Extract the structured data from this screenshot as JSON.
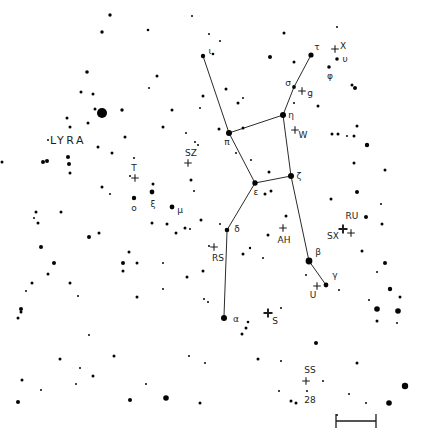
{
  "canvas": {
    "width": 427,
    "height": 441,
    "background": "#ffffff",
    "star_color": "#050505",
    "line_color": "#2b2b2b",
    "label_color": "#1c1c1c"
  },
  "constellation_label": {
    "text": "LYRA",
    "x": 68,
    "y": 141
  },
  "chart_data": {
    "type": "scatter",
    "constellation_lines": [
      [
        203,
        56,
        229,
        133
      ],
      [
        229,
        133,
        283,
        115
      ],
      [
        283,
        115,
        291,
        176
      ],
      [
        291,
        176,
        255,
        183
      ],
      [
        255,
        183,
        229,
        133
      ],
      [
        283,
        115,
        294,
        87
      ],
      [
        294,
        87,
        311,
        55
      ],
      [
        291,
        176,
        309,
        261
      ],
      [
        309,
        261,
        326,
        285
      ],
      [
        255,
        183,
        227,
        230
      ],
      [
        227,
        232,
        224,
        316
      ]
    ],
    "named_stars": [
      {
        "label": "ι",
        "x": 203,
        "y": 56,
        "r": 2.2,
        "lx": 210,
        "ly": 51
      },
      {
        "label": "τ",
        "x": 311,
        "y": 55,
        "r": 2.6,
        "lx": 317,
        "ly": 47
      },
      {
        "label": "σ",
        "x": 294,
        "y": 87,
        "r": 1.9,
        "lx": 288,
        "ly": 83
      },
      {
        "label": "η",
        "x": 283,
        "y": 115,
        "r": 3.0,
        "lx": 291,
        "ly": 115
      },
      {
        "label": "π",
        "x": 229,
        "y": 133,
        "r": 3.0,
        "lx": 227,
        "ly": 142
      },
      {
        "label": "ζ",
        "x": 291,
        "y": 176,
        "r": 3.0,
        "lx": 299,
        "ly": 176
      },
      {
        "label": "ε",
        "x": 255,
        "y": 183,
        "r": 2.7,
        "lx": 256,
        "ly": 192
      },
      {
        "label": "δ",
        "x": 227,
        "y": 230,
        "r": 2.3,
        "lx": 237,
        "ly": 229
      },
      {
        "label": "β",
        "x": 309,
        "y": 261,
        "r": 3.4,
        "lx": 318,
        "ly": 252
      },
      {
        "label": "γ",
        "x": 326,
        "y": 285,
        "r": 2.4,
        "lx": 335,
        "ly": 275
      },
      {
        "label": "α",
        "x": 224,
        "y": 318,
        "r": 3.0,
        "lx": 236,
        "ly": 319
      },
      {
        "label": "μ",
        "x": 172,
        "y": 207,
        "r": 2.4,
        "lx": 180,
        "ly": 210
      },
      {
        "label": "ξ",
        "x": 152,
        "y": 192,
        "r": 2.4,
        "lx": 153,
        "ly": 204
      },
      {
        "label": "ο",
        "x": 134,
        "y": 198,
        "r": 2.2,
        "lx": 134,
        "ly": 208
      },
      {
        "label": "υ",
        "x": 337,
        "y": 59,
        "r": 1.8,
        "lx": 345,
        "ly": 59
      },
      {
        "label": "φ",
        "x": 329,
        "y": 67,
        "r": 1.8,
        "lx": 330,
        "ly": 76
      }
    ],
    "variable_markers": [
      {
        "label": "X",
        "x": 335,
        "y": 49,
        "lx": 343,
        "ly": 46,
        "bold": false
      },
      {
        "label": "g",
        "x": 302,
        "y": 91,
        "lx": 310,
        "ly": 93,
        "bold": false
      },
      {
        "label": "W",
        "x": 295,
        "y": 130,
        "lx": 303,
        "ly": 135,
        "bold": false
      },
      {
        "label": "SZ",
        "x": 188,
        "y": 163,
        "lx": 191,
        "ly": 153,
        "bold": false
      },
      {
        "label": "T",
        "x": 135,
        "y": 178,
        "lx": 134,
        "ly": 168,
        "bold": false
      },
      {
        "label": "RS",
        "x": 214,
        "y": 247,
        "lx": 218,
        "ly": 258,
        "bold": false
      },
      {
        "label": "AH",
        "x": 283,
        "y": 228,
        "lx": 284,
        "ly": 240,
        "bold": false
      },
      {
        "label": "SX",
        "x": 343,
        "y": 229,
        "lx": 333,
        "ly": 236,
        "bold": true
      },
      {
        "label": "RU",
        "x": 351,
        "y": 233,
        "lx": 352,
        "ly": 216,
        "bold": false
      },
      {
        "label": "U",
        "x": 317,
        "y": 286,
        "lx": 313,
        "ly": 295,
        "bold": false
      },
      {
        "label": "S",
        "x": 268,
        "y": 313,
        "lx": 275,
        "ly": 321,
        "bold": true
      },
      {
        "label": "SS",
        "x": 306,
        "y": 381,
        "lx": 310,
        "ly": 370,
        "bold": false
      },
      {
        "label": "28",
        "x": 307,
        "y": 391,
        "lx": 310,
        "ly": 400,
        "bold": false,
        "dot_only": true
      }
    ],
    "field_stars": [
      [
        110,
        15,
        1.7
      ],
      [
        192,
        16,
        1
      ],
      [
        102,
        32,
        1.7
      ],
      [
        148,
        30,
        1.3
      ],
      [
        209,
        34,
        1
      ],
      [
        220,
        41,
        1
      ],
      [
        284,
        33,
        1.5
      ],
      [
        337,
        27,
        1
      ],
      [
        213,
        54,
        1.3
      ],
      [
        270,
        57,
        2
      ],
      [
        294,
        62,
        1.5
      ],
      [
        352,
        85,
        1.5
      ],
      [
        355,
        88,
        2
      ],
      [
        87,
        72,
        1.8
      ],
      [
        157,
        76,
        1.5
      ],
      [
        81,
        92,
        1.5
      ],
      [
        93,
        94,
        1.5
      ],
      [
        149,
        88,
        1
      ],
      [
        203,
        96,
        1.5
      ],
      [
        226,
        89,
        1.5
      ],
      [
        243,
        98,
        1
      ],
      [
        200,
        108,
        1
      ],
      [
        238,
        103,
        1.5
      ],
      [
        294,
        103,
        1
      ],
      [
        318,
        106,
        1.5
      ],
      [
        95,
        109,
        1.5
      ],
      [
        102,
        113,
        5
      ],
      [
        122,
        110,
        1.7
      ],
      [
        172,
        110,
        1.5
      ],
      [
        163,
        127,
        1.5
      ],
      [
        186,
        133,
        1
      ],
      [
        67,
        118,
        1.5
      ],
      [
        70,
        127,
        1.5
      ],
      [
        88,
        123,
        1.5
      ],
      [
        125,
        137,
        1.5
      ],
      [
        48,
        140,
        1
      ],
      [
        98,
        147,
        1.5
      ],
      [
        112,
        153,
        1.5
      ],
      [
        2,
        162,
        1.5
      ],
      [
        134,
        158,
        1
      ],
      [
        130,
        176,
        1
      ],
      [
        153,
        184,
        1.5
      ],
      [
        191,
        180,
        1.5
      ],
      [
        194,
        191,
        1
      ],
      [
        195,
        142,
        1
      ],
      [
        198,
        145,
        1
      ],
      [
        219,
        129,
        1.5
      ],
      [
        243,
        128,
        1.5
      ],
      [
        236,
        153,
        1
      ],
      [
        251,
        160,
        1
      ],
      [
        269,
        172,
        1.5
      ],
      [
        271,
        191,
        1.5
      ],
      [
        265,
        194,
        1.5
      ],
      [
        102,
        187,
        1.5
      ],
      [
        110,
        194,
        1
      ],
      [
        43,
        162,
        2
      ],
      [
        47,
        161,
        2
      ],
      [
        68,
        157,
        2
      ],
      [
        69,
        164,
        2
      ],
      [
        70,
        173,
        1.5
      ],
      [
        36,
        212,
        1.5
      ],
      [
        61,
        212,
        1.5
      ],
      [
        34,
        218,
        1
      ],
      [
        332,
        134,
        1.5
      ],
      [
        338,
        134,
        1.5
      ],
      [
        347,
        136,
        1
      ],
      [
        354,
        136,
        1.5
      ],
      [
        357,
        126,
        1.5
      ],
      [
        367,
        145,
        2.2
      ],
      [
        354,
        163,
        1.5
      ],
      [
        385,
        170,
        1.5
      ],
      [
        357,
        192,
        2
      ],
      [
        331,
        199,
        1.5
      ],
      [
        366,
        217,
        2
      ],
      [
        381,
        204,
        1
      ],
      [
        382,
        224,
        1.5
      ],
      [
        152,
        223,
        1.5
      ],
      [
        167,
        224,
        1.5
      ],
      [
        176,
        233,
        1.5
      ],
      [
        190,
        229,
        1
      ],
      [
        201,
        220,
        1.5
      ],
      [
        185,
        228,
        1.5
      ],
      [
        220,
        224,
        1
      ],
      [
        209,
        246,
        1
      ],
      [
        250,
        248,
        1.2
      ],
      [
        243,
        254,
        1.5
      ],
      [
        263,
        258,
        1
      ],
      [
        268,
        235,
        1.5
      ],
      [
        286,
        216,
        1.5
      ],
      [
        38,
        223,
        1.5
      ],
      [
        99,
        233,
        1.5
      ],
      [
        89,
        237,
        2
      ],
      [
        41,
        247,
        2
      ],
      [
        54,
        263,
        2
      ],
      [
        48,
        274,
        1.5
      ],
      [
        32,
        283,
        1.5
      ],
      [
        26,
        291,
        1
      ],
      [
        70,
        283,
        1.5
      ],
      [
        78,
        296,
        1
      ],
      [
        21,
        309,
        2
      ],
      [
        21,
        312,
        1.5
      ],
      [
        18,
        318,
        1.5
      ],
      [
        89,
        335,
        1
      ],
      [
        129,
        252,
        1.5
      ],
      [
        137,
        263,
        1.5
      ],
      [
        123,
        263,
        2
      ],
      [
        123,
        271,
        1.5
      ],
      [
        163,
        263,
        1
      ],
      [
        163,
        289,
        1
      ],
      [
        187,
        277,
        1.5
      ],
      [
        203,
        271,
        1.5
      ],
      [
        204,
        299,
        1
      ],
      [
        137,
        297,
        1.5
      ],
      [
        362,
        251,
        1.5
      ],
      [
        385,
        263,
        2
      ],
      [
        377,
        272,
        1
      ],
      [
        390,
        289,
        2.2
      ],
      [
        400,
        297,
        1.5
      ],
      [
        369,
        300,
        1
      ],
      [
        377,
        309,
        2.8
      ],
      [
        398,
        311,
        2.8
      ],
      [
        377,
        321,
        1.5
      ],
      [
        397,
        323,
        1
      ],
      [
        306,
        275,
        1
      ],
      [
        339,
        290,
        1
      ],
      [
        281,
        308,
        1
      ],
      [
        208,
        302,
        1
      ],
      [
        248,
        322,
        1.3
      ],
      [
        246,
        328,
        1.5
      ],
      [
        242,
        334,
        1.5
      ],
      [
        316,
        343,
        2
      ],
      [
        357,
        363,
        1.5
      ],
      [
        258,
        359,
        1.5
      ],
      [
        281,
        361,
        1
      ],
      [
        323,
        381,
        1
      ],
      [
        279,
        391,
        1
      ],
      [
        291,
        401,
        1.5
      ],
      [
        296,
        403,
        1.5
      ],
      [
        337,
        415,
        1
      ],
      [
        349,
        394,
        1
      ],
      [
        366,
        403,
        1
      ],
      [
        389,
        403,
        2.8
      ],
      [
        405,
        386,
        3.2
      ],
      [
        114,
        356,
        1.5
      ],
      [
        60,
        359,
        1.5
      ],
      [
        80,
        368,
        1
      ],
      [
        93,
        376,
        1.5
      ],
      [
        22,
        380,
        1.5
      ],
      [
        41,
        390,
        1
      ],
      [
        76,
        384,
        1
      ],
      [
        146,
        384,
        1
      ],
      [
        18,
        402,
        2
      ],
      [
        130,
        400,
        2
      ],
      [
        166,
        398,
        2.8
      ],
      [
        200,
        403,
        1.5
      ],
      [
        189,
        356,
        1
      ],
      [
        205,
        363,
        1
      ]
    ],
    "scale_bar": {
      "x1": 336,
      "x2": 376,
      "y": 421,
      "tick_half_height": 7
    }
  }
}
